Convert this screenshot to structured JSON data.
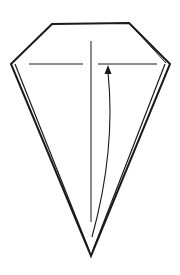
{
  "diagram": {
    "type": "origami-fold-step",
    "shape": "kite / diamond base",
    "colors": {
      "background": "#ffffff",
      "stroke": "#1a1a1a"
    },
    "outline": {
      "outer": [
        [
          52,
          24
        ],
        [
          129,
          23
        ],
        [
          170,
          64
        ],
        [
          91,
          256
        ],
        [
          11,
          64
        ]
      ],
      "inner": [
        [
          53,
          26
        ],
        [
          128,
          25
        ],
        [
          165,
          64
        ],
        [
          91,
          251
        ],
        [
          15,
          64
        ]
      ]
    },
    "horizontal_creases": [
      {
        "x1": 29,
        "y1": 64,
        "x2": 83,
        "y2": 64
      },
      {
        "x1": 98,
        "y1": 64,
        "x2": 157,
        "y2": 64
      }
    ],
    "vertical_crease": {
      "x": 91,
      "y1": 41,
      "y2": 222
    },
    "fold_arrow": {
      "path": "M 92 237 Q 116 150 108 72",
      "arrowhead_tip": [
        108,
        66
      ],
      "direction": "up"
    },
    "caption": ""
  }
}
